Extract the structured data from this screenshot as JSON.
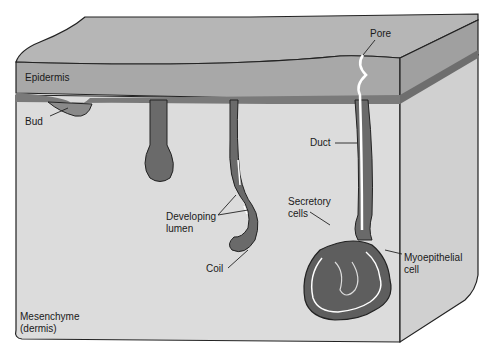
{
  "diagram": {
    "type": "anatomical cross-section",
    "colors": {
      "epidermis": "#a8a8a8",
      "epidermis_top": "#b6b6b6",
      "basal_layer": "#6e6e6e",
      "gland": "#6a6a6a",
      "mesenchyme": "#dcdcdc",
      "side_face": "#cfcfcf",
      "lumen": "#ffffff",
      "outline": "#222222"
    },
    "labels": {
      "pore": "Pore",
      "epidermis": "Epidermis",
      "bud": "Bud",
      "duct": "Duct",
      "secretory_cells_1": "Secretory",
      "secretory_cells_2": "cells",
      "developing_lumen_1": "Developing",
      "developing_lumen_2": "lumen",
      "myoepithelial_1": "Myoepithelial",
      "myoepithelial_2": "cell",
      "coil": "Coil",
      "mesenchyme_1": "Mesenchyme",
      "mesenchyme_2": "(dermis)"
    }
  }
}
